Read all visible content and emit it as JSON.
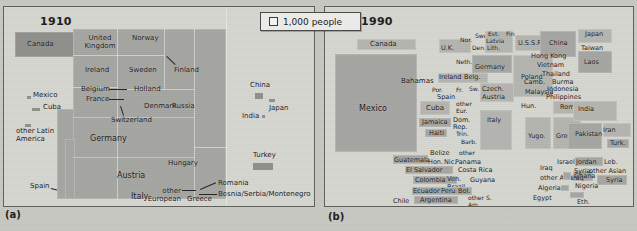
{
  "figure": {
    "legend": {
      "symbol": "square-outline",
      "text": "1,000 people"
    },
    "panels": [
      {
        "id": "a",
        "year": "1910",
        "caption": "(a)",
        "labels": [
          "Canada",
          "Mexico",
          "Cuba",
          "other Latin America",
          "Spain",
          "United Kingdom",
          "Ireland",
          "Belgium",
          "France",
          "Switzerland",
          "Germany",
          "Austria",
          "Italy",
          "Norway",
          "Sweden",
          "Holland",
          "Denmark",
          "Finland",
          "Russia",
          "Hungary",
          "other European",
          "Greece",
          "Romania",
          "Bosnia/Serbia/Montenegro",
          "Turkey",
          "China",
          "Japan",
          "India"
        ]
      },
      {
        "id": "b",
        "year": "1990",
        "caption": "(b)",
        "labels": [
          "Canada",
          "Mexico",
          "Bahamas",
          "Cuba",
          "Jamaica",
          "Haiti",
          "Dom. Rep.",
          "Trin.",
          "Barb.",
          "other",
          "Guatemala",
          "Belize",
          "Hon.",
          "Nic.",
          "El Salvador",
          "Panama",
          "Costa Rica",
          "Colombia",
          "Ven.",
          "Guyana",
          "Ecuador",
          "Peru",
          "Bol.",
          "Brazil",
          "Chile",
          "Argentina",
          "other S. Am.",
          "U.K.",
          "Nor.",
          "Swe.",
          "Den.",
          "Est.",
          "Latvia",
          "Lith.",
          "Fin.",
          "U.S.S.R.",
          "Neth.",
          "Ireland",
          "Belg.",
          "Germany",
          "Poland",
          "Por.",
          "Spain",
          "Fr.",
          "Sw.",
          "Czech.",
          "Austria",
          "other Eur.",
          "Hun.",
          "Rom.",
          "Italy",
          "Yugo.",
          "Greece",
          "China",
          "Japan",
          "Taiwan",
          "Hong Kong",
          "Vietnam",
          "Korea",
          "Laos",
          "Thailand",
          "Camb.",
          "Burma",
          "Malaysia",
          "Indonesia",
          "Philippines",
          "India",
          "Pakistan",
          "Iran",
          "Turk.",
          "Israel",
          "Jordan",
          "Leb.",
          "Syria",
          "Iraq",
          "other Asian",
          "Algeria",
          "Ghana",
          "Nigeria",
          "Egypt",
          "Eth.",
          "other Africa",
          "South Africa"
        ]
      }
    ]
  }
}
